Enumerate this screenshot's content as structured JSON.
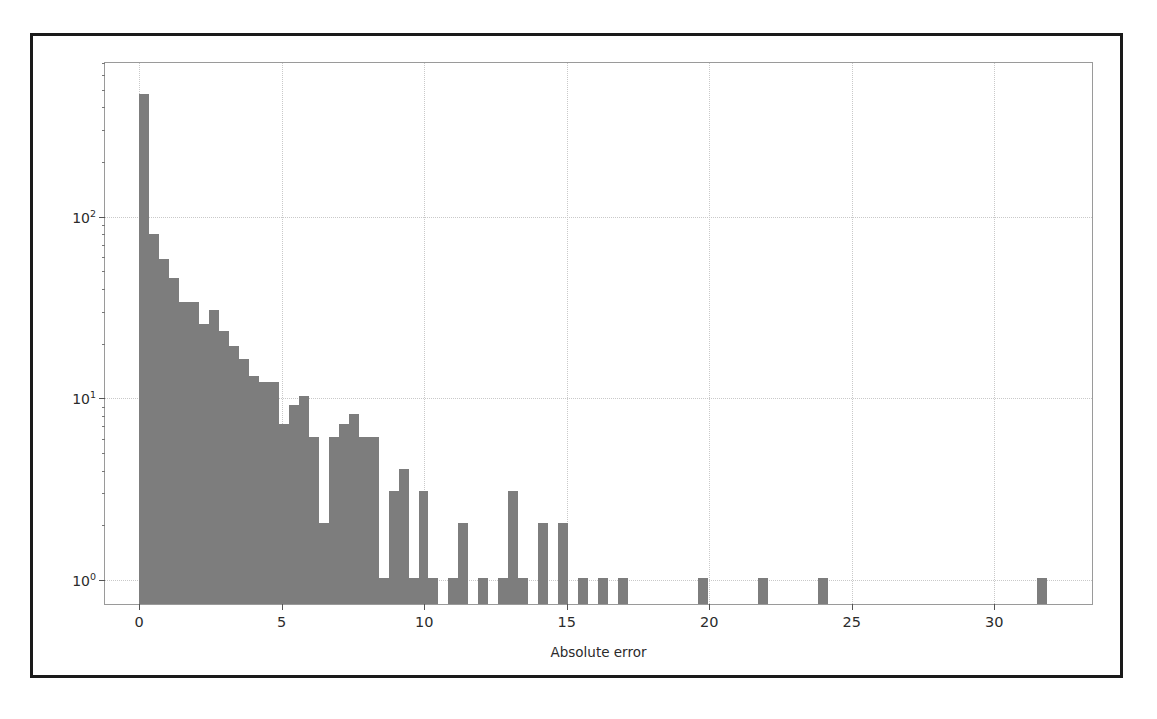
{
  "figure": {
    "frame_color": "#1a1a1a",
    "bar_color": "#7d7d7d",
    "grid_color": "#c9c9c9"
  },
  "chart_data": {
    "type": "bar",
    "title": "",
    "xlabel": "Absolute error",
    "ylabel": "Sample count",
    "yscale": "log",
    "xlim": [
      -1.2,
      33.5
    ],
    "ylim": [
      0.72,
      700
    ],
    "grid": true,
    "legend": null,
    "bin_width": 0.35,
    "x_ticks": [
      0,
      5,
      10,
      15,
      20,
      25,
      30
    ],
    "x_tick_labels": [
      "0",
      "5",
      "10",
      "15",
      "20",
      "25",
      "30"
    ],
    "y_ticks": [
      1,
      10,
      100
    ],
    "y_tick_labels": [
      "10⁰",
      "10¹",
      "10²"
    ],
    "y_tick_label_sup": [
      "0",
      "1",
      "2"
    ],
    "bin_left_edges": [
      0.0,
      0.35,
      0.7,
      1.05,
      1.4,
      1.75,
      2.1,
      2.45,
      2.8,
      3.15,
      3.5,
      3.85,
      4.2,
      4.55,
      4.9,
      5.25,
      5.6,
      5.95,
      6.3,
      6.65,
      7.0,
      7.35,
      7.7,
      8.05,
      8.4,
      8.75,
      9.1,
      9.45,
      9.8,
      10.15,
      10.5,
      10.85,
      11.2,
      11.55,
      11.9,
      12.25,
      12.6,
      12.95,
      13.3,
      13.65,
      14.0,
      14.35,
      14.7,
      15.05,
      15.4,
      15.75,
      16.1,
      16.45,
      16.8,
      17.15,
      17.5,
      17.85,
      18.2,
      18.55,
      18.9,
      19.25,
      19.6,
      19.95,
      20.3,
      20.65,
      21.0,
      21.35,
      21.7,
      22.05,
      22.4,
      22.75,
      23.1,
      23.45,
      23.8,
      24.15,
      24.5,
      24.85,
      25.2,
      25.55,
      25.9,
      26.25,
      26.6,
      26.95,
      27.3,
      27.65,
      28.0,
      28.35,
      28.7,
      29.05,
      29.4,
      29.75,
      30.1,
      30.45,
      30.8,
      31.15,
      31.5,
      31.85
    ],
    "values": [
      460,
      78,
      57,
      45,
      33,
      33,
      25,
      30,
      23,
      19,
      16,
      13,
      12,
      12,
      7,
      9,
      10,
      6,
      2,
      6,
      7,
      8,
      6,
      6,
      1,
      3,
      4,
      1,
      3,
      1,
      0,
      1,
      2,
      0,
      1,
      0,
      1,
      3,
      1,
      0,
      2,
      0,
      2,
      0,
      1,
      0,
      1,
      0,
      1,
      0,
      0,
      0,
      0,
      0,
      0,
      0,
      1,
      0,
      0,
      0,
      0,
      0,
      1,
      0,
      0,
      0,
      0,
      0,
      1,
      0,
      0,
      0,
      0,
      0,
      0,
      0,
      0,
      0,
      0,
      0,
      0,
      0,
      0,
      0,
      0,
      0,
      0,
      0,
      0,
      0,
      1,
      0
    ]
  }
}
